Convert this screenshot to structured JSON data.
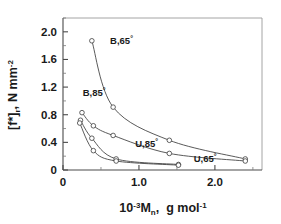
{
  "chart_data": {
    "type": "line",
    "title": "",
    "subtitle": "",
    "xlabel": "10-3Mn,  g mol-1",
    "xlabel_parts": {
      "base": "10",
      "exp": "-3",
      "symbol": "M",
      "subscript": "n",
      "comma": ",",
      "unit_base": "g mol",
      "unit_exp": "-1"
    },
    "ylabel": "[f*]r, N mm-2",
    "ylabel_parts": {
      "bracket": "[f*]",
      "subscript": "r",
      "comma": ",",
      "unit": "N mm",
      "unit_exp": "-2"
    },
    "xlim": [
      0,
      2.62
    ],
    "ylim": [
      0,
      2.2
    ],
    "xticks": [
      0,
      1.0,
      2.0
    ],
    "xticklabels": [
      "0",
      "1.0",
      "2.0"
    ],
    "xminorticks": [
      0.5,
      1.5,
      2.5
    ],
    "yticks": [
      0,
      0.4,
      0.8,
      1.2,
      1.6,
      2.0
    ],
    "yticklabels": [
      "0",
      "0.4",
      "0.8",
      "1.2",
      "1.6",
      "2.0"
    ],
    "yminorticks": [
      0.2,
      0.6,
      1.0,
      1.4,
      1.8,
      2.2
    ],
    "grid": false,
    "legend_position": "inline-annotations",
    "marker": "open-circle",
    "series": [
      {
        "name": "B,65",
        "label": "B,65",
        "degree": "°",
        "annotation_x": 0.62,
        "annotation_y": 1.86,
        "x": [
          0.38,
          0.66,
          1.4,
          2.4
        ],
        "y": [
          1.87,
          0.91,
          0.43,
          0.16
        ]
      },
      {
        "name": "B,85",
        "label": "B,85",
        "degree": "°",
        "annotation_x": 0.26,
        "annotation_y": 1.12,
        "x": [
          0.25,
          0.4,
          0.66,
          1.4,
          2.4
        ],
        "y": [
          0.83,
          0.64,
          0.5,
          0.24,
          0.13
        ]
      },
      {
        "name": "U,85",
        "label": "U,85",
        "degree": "°",
        "annotation_x": 0.95,
        "annotation_y": 0.38,
        "x": [
          0.23,
          0.38,
          0.7,
          1.52
        ],
        "y": [
          0.72,
          0.46,
          0.16,
          0.08
        ]
      },
      {
        "name": "U,65",
        "label": "U,65",
        "degree": "°",
        "annotation_x": 1.72,
        "annotation_y": 0.155,
        "x": [
          0.22,
          0.4,
          0.7,
          1.52
        ],
        "y": [
          0.68,
          0.28,
          0.13,
          0.07
        ]
      }
    ]
  }
}
